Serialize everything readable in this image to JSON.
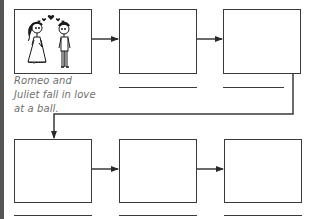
{
  "diagram": {
    "type": "storyboard-sequence",
    "rows": 2,
    "boxes_per_row": 3,
    "boxes": [
      {
        "id": 1,
        "row": 1,
        "image": "romeo-and-juliet-illustration",
        "caption": "Romeo and Juliet fall in love at a ball."
      },
      {
        "id": 2,
        "row": 1,
        "image": "",
        "caption": ""
      },
      {
        "id": 3,
        "row": 1,
        "image": "",
        "caption": ""
      },
      {
        "id": 4,
        "row": 2,
        "image": "",
        "caption": ""
      },
      {
        "id": 5,
        "row": 2,
        "image": "",
        "caption": ""
      },
      {
        "id": 6,
        "row": 2,
        "image": "",
        "caption": ""
      }
    ],
    "flow": [
      "1->2",
      "2->3",
      "3->4",
      "4->5",
      "5->6"
    ],
    "colors": {
      "line": "#3a3a3a",
      "caption_text": "#6f6f6f",
      "heart": "#1a1a1a"
    }
  }
}
